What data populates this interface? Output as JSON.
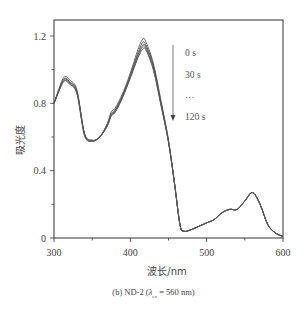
{
  "chart_data": {
    "type": "line",
    "title": "",
    "caption": "(b) ND-2 (λex = 560 nm)",
    "xlabel": "波长/nm",
    "ylabel": "吸光度",
    "xlim": [
      300,
      600
    ],
    "ylim": [
      0,
      1.3
    ],
    "xticks": [
      300,
      400,
      500,
      600
    ],
    "xtick_labels": [
      "300",
      "400",
      "500",
      "600"
    ],
    "yticks": [
      0,
      0.4,
      0.8,
      1.2
    ],
    "ytick_labels": [
      "0",
      "0.4",
      "0.8",
      "1.2"
    ],
    "grid": false,
    "legend": {
      "position": "upper-right-annotation",
      "entries": [
        "0 s",
        "30 s",
        "…",
        "120 s"
      ],
      "arrow": "down"
    },
    "x": [
      300,
      310,
      315,
      320,
      330,
      340,
      350,
      360,
      370,
      375,
      380,
      390,
      400,
      410,
      416,
      420,
      430,
      440,
      450,
      458,
      465,
      470,
      480,
      490,
      500,
      510,
      520,
      530,
      540,
      550,
      560,
      570,
      580,
      590,
      600
    ],
    "series": [
      {
        "name": "0 s",
        "values": [
          0.8,
          0.93,
          0.96,
          0.94,
          0.88,
          0.62,
          0.58,
          0.6,
          0.68,
          0.75,
          0.77,
          0.86,
          0.98,
          1.12,
          1.18,
          1.17,
          1.04,
          0.82,
          0.58,
          0.32,
          0.08,
          0.04,
          0.05,
          0.07,
          0.09,
          0.11,
          0.15,
          0.17,
          0.17,
          0.22,
          0.27,
          0.2,
          0.08,
          0.03,
          0.01
        ]
      },
      {
        "name": "30 s",
        "values": [
          0.8,
          0.92,
          0.95,
          0.93,
          0.87,
          0.62,
          0.58,
          0.6,
          0.68,
          0.74,
          0.76,
          0.85,
          0.97,
          1.1,
          1.16,
          1.15,
          1.03,
          0.81,
          0.58,
          0.32,
          0.08,
          0.04,
          0.05,
          0.07,
          0.09,
          0.11,
          0.15,
          0.17,
          0.17,
          0.22,
          0.27,
          0.2,
          0.08,
          0.03,
          0.01
        ]
      },
      {
        "name": "60 s",
        "values": [
          0.8,
          0.92,
          0.945,
          0.925,
          0.87,
          0.62,
          0.58,
          0.6,
          0.67,
          0.735,
          0.755,
          0.845,
          0.96,
          1.09,
          1.145,
          1.14,
          1.02,
          0.8,
          0.57,
          0.32,
          0.08,
          0.04,
          0.05,
          0.07,
          0.09,
          0.11,
          0.15,
          0.17,
          0.17,
          0.22,
          0.27,
          0.2,
          0.08,
          0.03,
          0.01
        ]
      },
      {
        "name": "90 s",
        "values": [
          0.8,
          0.91,
          0.94,
          0.92,
          0.86,
          0.61,
          0.575,
          0.6,
          0.67,
          0.73,
          0.75,
          0.84,
          0.955,
          1.08,
          1.135,
          1.13,
          1.01,
          0.8,
          0.57,
          0.32,
          0.08,
          0.04,
          0.05,
          0.07,
          0.09,
          0.11,
          0.15,
          0.17,
          0.17,
          0.22,
          0.27,
          0.2,
          0.08,
          0.03,
          0.01
        ]
      },
      {
        "name": "120 s",
        "values": [
          0.8,
          0.91,
          0.935,
          0.915,
          0.86,
          0.61,
          0.575,
          0.6,
          0.665,
          0.725,
          0.745,
          0.835,
          0.95,
          1.07,
          1.12,
          1.12,
          1.0,
          0.79,
          0.57,
          0.32,
          0.08,
          0.04,
          0.05,
          0.07,
          0.09,
          0.11,
          0.15,
          0.17,
          0.17,
          0.22,
          0.27,
          0.2,
          0.08,
          0.03,
          0.01
        ]
      }
    ]
  },
  "labels": {
    "xlabel": "波长/nm",
    "ylabel": "吸光度",
    "legend_0": "0 s",
    "legend_1": "30 s",
    "legend_2": "…",
    "legend_3": "120 s",
    "caption_prefix": "(b) ND-2 (",
    "caption_lambda": "λ",
    "caption_sub": "ex",
    "caption_suffix": " = 560 nm)"
  },
  "style": {
    "line_color": "#555555",
    "axis_color": "#333333"
  }
}
